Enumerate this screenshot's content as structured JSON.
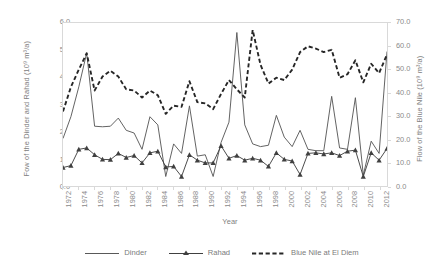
{
  "chart_data": {
    "type": "line",
    "title": "",
    "xlabel": "Year",
    "ylabel": "Fow of the Dinder and Rahad (10⁹ m³/a)",
    "ylabel_secondary": "Flow of the Blue Nile (10⁹ m³/a)",
    "grid": false,
    "legend_position": "bottom",
    "ylim": [
      0.0,
      6.0
    ],
    "ylim_secondary": [
      0.0,
      70.0
    ],
    "xlim": [
      1972,
      2013
    ],
    "yticks": [
      "0.0",
      "1.0",
      "2.0",
      "3.0",
      "4.0",
      "5.0",
      "6.0"
    ],
    "yticks_secondary": [
      "0.0",
      "10.0",
      "20.0",
      "30.0",
      "40.0",
      "50.0",
      "60.0",
      "70.0"
    ],
    "x": [
      1972,
      1973,
      1974,
      1975,
      1976,
      1977,
      1978,
      1979,
      1980,
      1981,
      1982,
      1983,
      1984,
      1985,
      1986,
      1987,
      1988,
      1989,
      1990,
      1991,
      1992,
      1993,
      1994,
      1995,
      1996,
      1997,
      1998,
      1999,
      2000,
      2001,
      2002,
      2003,
      2004,
      2005,
      2006,
      2007,
      2008,
      2009,
      2010,
      2011,
      2012,
      2013
    ],
    "xticks": [
      1972,
      1974,
      1976,
      1978,
      1980,
      1982,
      1984,
      1986,
      1988,
      1990,
      1992,
      1994,
      1996,
      1998,
      2000,
      2002,
      2004,
      2006,
      2008,
      2010,
      2012
    ],
    "series": [
      {
        "name": "Dinder",
        "axis": "left",
        "style": "solid",
        "marker": "none",
        "color": "#595959",
        "values": [
          1.75,
          2.55,
          3.65,
          4.9,
          2.2,
          2.18,
          2.2,
          2.5,
          2.05,
          1.95,
          1.35,
          2.55,
          2.25,
          0.35,
          1.55,
          1.2,
          2.95,
          1.1,
          1.15,
          0.35,
          1.6,
          2.35,
          5.65,
          2.25,
          1.55,
          1.45,
          1.5,
          2.6,
          1.8,
          1.45,
          2.05,
          1.35,
          1.3,
          1.3,
          3.3,
          1.4,
          1.35,
          3.25,
          0.4,
          1.65,
          1.2,
          4.95
        ]
      },
      {
        "name": "Rahad",
        "axis": "left",
        "style": "solid",
        "marker": "triangle",
        "color": "#404040",
        "values": [
          0.68,
          0.75,
          1.35,
          1.4,
          1.15,
          0.98,
          0.97,
          1.2,
          1.05,
          1.12,
          0.85,
          1.22,
          1.28,
          0.7,
          0.72,
          0.35,
          1.15,
          0.95,
          0.85,
          0.85,
          1.48,
          1.02,
          1.12,
          0.95,
          1.02,
          0.95,
          0.72,
          1.22,
          0.98,
          0.92,
          0.42,
          1.2,
          1.22,
          1.18,
          1.22,
          1.12,
          1.28,
          1.32,
          0.35,
          1.22,
          0.95,
          1.38
        ]
      },
      {
        "name": "Blue Nile at El Diem",
        "axis": "right",
        "style": "dashed",
        "marker": "none",
        "color": "#262626",
        "values": [
          32.0,
          42.5,
          50.0,
          57.0,
          41.0,
          47.0,
          49.5,
          47.0,
          41.5,
          41.0,
          38.0,
          41.0,
          39.0,
          31.0,
          34.5,
          34.0,
          45.0,
          36.0,
          35.5,
          33.0,
          39.5,
          45.5,
          41.5,
          38.0,
          67.0,
          52.0,
          44.0,
          46.5,
          45.5,
          50.0,
          57.5,
          60.0,
          59.0,
          57.5,
          58.5,
          46.5,
          48.0,
          54.0,
          44.5,
          52.5,
          48.5,
          56.5
        ]
      }
    ]
  },
  "legend": {
    "items": [
      {
        "label": "Dinder"
      },
      {
        "label": "Rahad"
      },
      {
        "label": "Blue Nile at El Diem"
      }
    ]
  }
}
